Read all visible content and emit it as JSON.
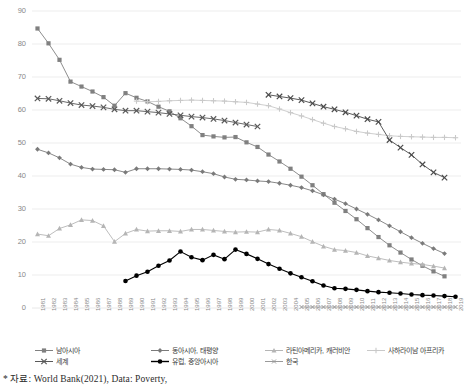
{
  "chart_data": {
    "type": "line",
    "title": "",
    "xlabel": "",
    "ylabel": "",
    "ylim": [
      0,
      90
    ],
    "ytick_step": 10,
    "grid": true,
    "legend_position": "bottom",
    "yticks": [
      "0",
      "10",
      "20",
      "30",
      "40",
      "50",
      "60",
      "70",
      "80",
      "90"
    ],
    "categories": [
      "1981",
      "1982",
      "1983",
      "1984",
      "1985",
      "1986",
      "1987",
      "1988",
      "1989",
      "1990",
      "1991",
      "1992",
      "1993",
      "1994",
      "1995",
      "1996",
      "1997",
      "1998",
      "1999",
      "2000",
      "2001",
      "2002",
      "2003",
      "2004",
      "2005",
      "2006",
      "2007",
      "2008",
      "2009",
      "2010",
      "2011",
      "2012",
      "2013",
      "2014",
      "2015",
      "2016",
      "2017",
      "2018",
      "2019"
    ],
    "series": [
      {
        "name": "남아시아",
        "marker": "square",
        "color": "#808080",
        "values": [
          84.7,
          80.2,
          75.2,
          68.6,
          67.1,
          65.6,
          63.9,
          61.3,
          65.1,
          63.7,
          62.6,
          61.0,
          59.6,
          57.5,
          55.1,
          52.4,
          52.0,
          51.7,
          51.8,
          50.2,
          48.8,
          46.5,
          44.4,
          42.2,
          39.8,
          37.2,
          34.5,
          31.9,
          29.4,
          26.9,
          24.2,
          21.5,
          19.0,
          16.8,
          14.7,
          12.8,
          11.1,
          9.6,
          null
        ]
      },
      {
        "name": "동아시아, 태평양",
        "marker": "diamond",
        "color": "#7a7a7a",
        "values": [
          48.1,
          47.0,
          45.5,
          43.6,
          42.6,
          42.1,
          42.0,
          41.9,
          41.1,
          42.2,
          42.2,
          42.2,
          42.1,
          42.0,
          41.8,
          41.3,
          40.7,
          39.7,
          39.0,
          38.8,
          38.5,
          38.3,
          37.8,
          37.2,
          36.5,
          35.5,
          34.3,
          33.0,
          31.6,
          30.0,
          28.4,
          26.7,
          24.9,
          23.1,
          21.3,
          19.6,
          18.0,
          16.5,
          null
        ]
      },
      {
        "name": "라틴아메리카, 캐러비안",
        "marker": "triangle",
        "color": "#b5b5b5",
        "values": [
          22.4,
          21.9,
          24.1,
          25.2,
          26.7,
          26.5,
          24.9,
          20.1,
          22.6,
          23.8,
          23.3,
          23.4,
          23.4,
          23.2,
          23.8,
          23.8,
          23.5,
          23.2,
          23.0,
          23.1,
          23.0,
          23.8,
          23.5,
          22.6,
          21.6,
          20.1,
          18.7,
          17.7,
          17.4,
          16.8,
          15.8,
          15.1,
          14.4,
          13.9,
          13.5,
          13.2,
          12.7,
          12.1,
          null
        ]
      },
      {
        "name": "사하라이남 아프리카",
        "marker": "plus",
        "color": "#c9c9c9",
        "values": [
          null,
          null,
          null,
          null,
          null,
          null,
          null,
          null,
          null,
          62.7,
          62.5,
          62.6,
          62.8,
          62.9,
          63.0,
          62.9,
          62.8,
          62.7,
          62.5,
          62.3,
          61.8,
          61.3,
          60.3,
          59.2,
          58.2,
          57.1,
          56.0,
          55.0,
          54.3,
          53.5,
          53.0,
          52.6,
          52.2,
          52.0,
          51.9,
          51.8,
          51.7,
          51.7,
          51.6
        ]
      },
      {
        "name": "세계",
        "marker": "cross",
        "color": "#595959",
        "values": [
          63.5,
          63.4,
          62.8,
          62.1,
          61.5,
          61.2,
          60.8,
          60.2,
          59.8,
          59.8,
          59.5,
          59.2,
          58.8,
          58.4,
          58.0,
          57.7,
          57.3,
          56.8,
          56.2,
          55.6,
          55.0,
          null,
          null,
          null,
          null,
          null,
          null,
          null,
          null,
          null,
          null,
          null,
          null,
          null,
          null,
          null,
          null,
          null,
          null
        ]
      },
      {
        "name": "유럽, 중앙아시아",
        "marker": "circle-filled",
        "color": "#000000",
        "values": [
          null,
          null,
          null,
          null,
          null,
          null,
          null,
          null,
          8.2,
          9.8,
          11.0,
          12.8,
          14.4,
          17.1,
          15.4,
          14.5,
          16.1,
          14.8,
          17.7,
          16.4,
          14.9,
          13.3,
          11.9,
          10.5,
          9.3,
          8.1,
          6.8,
          6.0,
          5.8,
          5.5,
          5.1,
          4.8,
          4.6,
          4.4,
          4.1,
          3.9,
          3.8,
          3.6,
          3.4
        ]
      },
      {
        "name": "한국",
        "marker": "cross-small",
        "color": "#9a9a9a",
        "values": [
          null,
          null,
          null,
          null,
          null,
          null,
          null,
          null,
          null,
          null,
          null,
          null,
          null,
          null,
          null,
          null,
          null,
          null,
          null,
          null,
          null,
          null,
          null,
          null,
          0.3,
          0.3,
          0.3,
          0.3,
          0.3,
          0.3,
          0.3,
          0.3,
          0.3,
          0.3,
          0.3,
          0.3,
          0.3,
          0.3,
          0.3
        ]
      },
      {
        "name": "세계(후반)",
        "marker": "cross",
        "color": "#4a4a4a",
        "values": [
          null,
          null,
          null,
          null,
          null,
          null,
          null,
          null,
          null,
          null,
          null,
          null,
          null,
          null,
          null,
          null,
          null,
          null,
          null,
          null,
          null,
          64.6,
          64.1,
          63.6,
          63.0,
          62.0,
          61.0,
          60.2,
          59.3,
          58.3,
          57.2,
          56.4,
          50.9,
          48.6,
          46.4,
          43.5,
          41.1,
          39.5,
          null
        ]
      }
    ],
    "annotations": []
  },
  "legend": {
    "items": [
      {
        "label": "남아시아",
        "marker": "square",
        "color": "#808080"
      },
      {
        "label": "동아시아, 태평양",
        "marker": "diamond",
        "color": "#7a7a7a"
      },
      {
        "label": "라틴아메리카, 캐러비안",
        "marker": "triangle",
        "color": "#b5b5b5"
      },
      {
        "label": "사하라이남 아프리카",
        "marker": "plus",
        "color": "#c9c9c9"
      },
      {
        "label": "세계",
        "marker": "cross",
        "color": "#595959"
      },
      {
        "label": "유럽, 중앙아시아",
        "marker": "circle-filled",
        "color": "#000000"
      },
      {
        "label": "한국",
        "marker": "cross-small",
        "color": "#9a9a9a"
      }
    ]
  },
  "footnote": {
    "text": "* 자료: World Bank(2021), Data: Poverty,"
  },
  "colors": {
    "grid": "#e8e8e8",
    "axis_text": "#8a8a8a",
    "background": "#ffffff"
  }
}
